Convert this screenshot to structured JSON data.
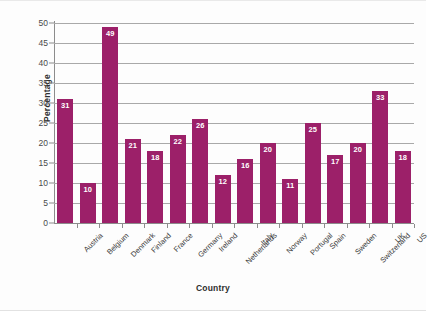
{
  "chart_data": {
    "type": "bar",
    "title": "",
    "xlabel": "Country",
    "ylabel": "Percentage",
    "categories": [
      "Austria",
      "Belgium",
      "Denmark",
      "Finland",
      "France",
      "Germany",
      "Ireland",
      "Netherlands",
      "Italy",
      "Norway",
      "Portugal",
      "Spain",
      "Sweden",
      "Switzerland",
      "UK",
      "US"
    ],
    "values": [
      31,
      10,
      49,
      21,
      18,
      22,
      26,
      12,
      16,
      20,
      11,
      25,
      17,
      20,
      33,
      18
    ],
    "ylim": [
      0,
      50
    ],
    "ytick_step": 5,
    "yticks": [
      0,
      5,
      10,
      15,
      20,
      25,
      30,
      35,
      40,
      45,
      50
    ],
    "grid": true,
    "grid_axis": "y",
    "legend": false,
    "bar_color": "#9c2069",
    "value_label_color": "#ffffff",
    "gridline_color": "#a9a9a9",
    "axis_color": "#8c8c8c",
    "background_color": "#fdfdfd"
  }
}
